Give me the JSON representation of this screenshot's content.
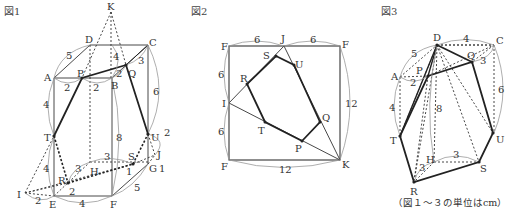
{
  "figures": [
    {
      "id": "fig1",
      "title": "図1",
      "points": {
        "K": "K",
        "D": "D",
        "C": "C",
        "A": "A",
        "P": "P",
        "B": "B",
        "Q": "Q",
        "T": "T",
        "U": "U",
        "S": "S",
        "J": "J",
        "G": "G",
        "H": "H",
        "R": "R",
        "I": "I",
        "E": "E",
        "F": "F"
      },
      "lengths": {
        "AD": "5",
        "KB_seg": "4",
        "CQ": "3",
        "AP": "2",
        "PB": "2",
        "QB": "2",
        "CG": "6",
        "AT": "4",
        "BF": "8",
        "UJ": "2",
        "GJ": "1",
        "SG": "1",
        "HS": "3",
        "RH": "3",
        "TE": "4",
        "RE": "2",
        "IE": "2",
        "EF": "4",
        "FG": "5"
      }
    },
    {
      "id": "fig2",
      "title": "図2",
      "points": {
        "F_tl": "F",
        "J": "J",
        "F_tr": "F",
        "I": "I",
        "F_bl": "F",
        "K": "K",
        "S": "S",
        "U": "U",
        "R": "R",
        "T": "T",
        "P": "P",
        "Q": "Q"
      },
      "lengths": {
        "FJ": "6",
        "JF": "6",
        "FI": "6",
        "IF": "6",
        "FK_bottom": "12",
        "FK_right": "12"
      }
    },
    {
      "id": "fig3",
      "title": "図3",
      "points": {
        "D": "D",
        "C": "C",
        "A": "A",
        "P": "P",
        "Q": "Q",
        "T": "T",
        "U": "U",
        "H": "H",
        "S": "S",
        "R": "R"
      },
      "lengths": {
        "DC": "4",
        "AD": "5",
        "CQ": "3",
        "AP": "2",
        "CU": "6",
        "AT": "4",
        "DH": "8",
        "HS": "3",
        "RH": "3"
      }
    }
  ],
  "footnote": "（図１～３の単位はcm）"
}
